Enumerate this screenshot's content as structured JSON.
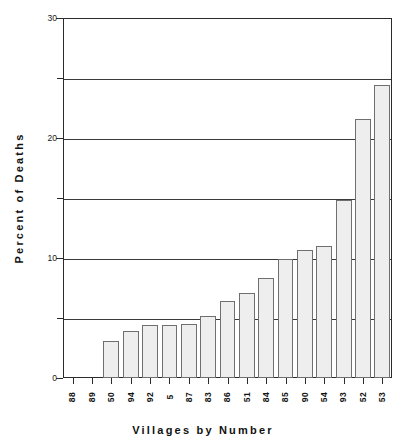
{
  "chart_data": {
    "type": "bar",
    "title": "",
    "xlabel": "Villages by Number",
    "ylabel": "Percent of Deaths",
    "categories": [
      "88",
      "89",
      "50",
      "94",
      "92",
      "5",
      "87",
      "83",
      "86",
      "51",
      "84",
      "85",
      "90",
      "54",
      "93",
      "52",
      "53"
    ],
    "values": [
      0,
      0,
      3.1,
      3.9,
      4.4,
      4.4,
      4.5,
      5.2,
      6.4,
      7.1,
      8.3,
      9.9,
      10.7,
      11.0,
      14.8,
      21.6,
      24.4
    ],
    "series": [
      {
        "name": "Percent of Deaths",
        "values": [
          0,
          0,
          3.1,
          3.9,
          4.4,
          4.4,
          4.5,
          5.2,
          6.4,
          7.1,
          8.3,
          9.9,
          10.7,
          11.0,
          14.8,
          21.6,
          24.4
        ]
      }
    ],
    "ylim": [
      0,
      30
    ],
    "ytick_labels": [
      "0",
      "10",
      "20",
      "30"
    ],
    "ytick_values": [
      0,
      10,
      20,
      30
    ],
    "gridline_values": [
      5,
      10,
      15,
      20,
      25,
      30
    ],
    "grid": true,
    "legend": "none",
    "bar_fill_color": "#eeeeee",
    "bar_edge_color": "#6f6f6f",
    "axis_color": "#2b2b2b",
    "background_color": "#ffffff"
  },
  "axes": {
    "y_title": "Percent of Deaths",
    "x_title": "Villages by Number",
    "y_labels": [
      {
        "text": "30",
        "value": 30
      },
      {
        "text": "20",
        "value": 20
      },
      {
        "text": "10",
        "value": 10
      },
      {
        "text": "0",
        "value": 0
      }
    ]
  }
}
